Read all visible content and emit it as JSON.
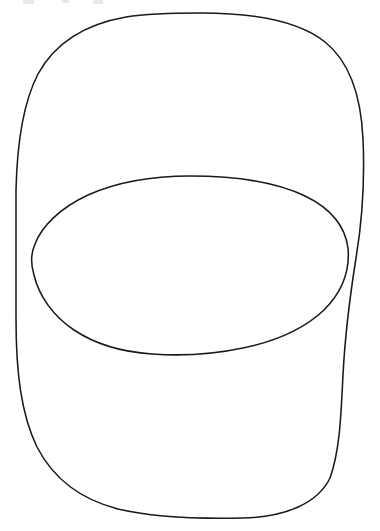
{
  "document": {
    "title": "Two Overlapping Hand-Drawn Closed Curves",
    "caption": "Line drawing: a large tall rounded closed curve overlapped by a smaller wide oval, crossing at two points on the left and right.",
    "background_color": "#ffffff",
    "width": 380,
    "height": 531
  },
  "style": {
    "ink_color": "#1a1a1a",
    "stroke_width": 1.55,
    "artifact_color": "#e9e9ec"
  },
  "figure": {
    "name": "two-overlapping-closed-curves",
    "shape_count": 2,
    "intersection_count": 2,
    "shapes": [
      {
        "id": "outer-curve",
        "label": "large tall rounded closed curve",
        "bounds": {
          "left": 16,
          "top": 13,
          "right": 363,
          "bottom": 518
        },
        "path": "M 201 13 C 258 13 300 22 325 42 C 350 62 361 95 363 139 C 365 183 362 222 356 258 C 350 296 345 335 343 375 C 341 415 340 450 330 478 C 318 503 286 517 243 518 C 200 519 152 517 118 509 C 83 500 54 480 37 447 C 21 414 16 372 16 318 C 16 268 16 228 16 190 C 17 146 22 105 38 74 C 55 43 86 24 126 17 C 151 13 176 13 201 13 Z"
      },
      {
        "id": "inner-oval",
        "label": "smaller wide oval",
        "bounds": {
          "left": 32,
          "top": 176,
          "right": 348,
          "bottom": 356
        },
        "path": "M 190 176 C 238 176 278 183 305 196 C 330 208 345 226 348 248 C 350 270 342 292 324 310 C 305 328 277 341 243 348 C 210 355 180 356 152 354 C 122 352 95 344 74 330 C 53 316 39 296 34 275 C 30 262 31 253 35 244 C 42 226 60 208 88 195 C 117 182 153 176 190 176 Z"
      }
    ],
    "intersections": [
      {
        "id": "intersection-left",
        "x": 33,
        "y": 262
      },
      {
        "id": "intersection-right",
        "x": 345,
        "y": 272
      }
    ],
    "edge_artifacts": [
      {
        "id": "artifact-1",
        "x": 23,
        "y": 0,
        "width": 11,
        "height": 4
      },
      {
        "id": "artifact-2",
        "x": 62,
        "y": 0,
        "width": 7,
        "height": 3
      },
      {
        "id": "artifact-3",
        "x": 93,
        "y": 0,
        "width": 10,
        "height": 4
      }
    ]
  }
}
